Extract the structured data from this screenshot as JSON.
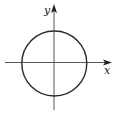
{
  "diagram": {
    "type": "unit-circle-on-axes",
    "x_axis_label": "x",
    "y_axis_label": "y",
    "colors": {
      "stroke": "#2a2a2a",
      "axis": "#555555",
      "background": "#ffffff"
    }
  }
}
